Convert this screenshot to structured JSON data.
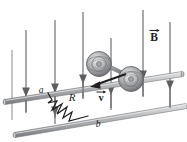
{
  "figure": {
    "title": "Conducting rod on rails in a magnetic field",
    "type": "physics-diagram",
    "canvas": {
      "width": 187,
      "height": 142,
      "background": "#ffffff"
    },
    "colors": {
      "rail": "#a8a9ad",
      "rail_edge": "#6d6e71",
      "rail_highlight": "#d6d7d9",
      "arrow": "#58595b",
      "arrow_dark": "#231f20",
      "wheel": "#a7a9ac",
      "wheel_edge": "#58595b",
      "resistor": "#231f20",
      "label": "#231f20"
    },
    "labels": {
      "terminal_a": "a",
      "terminal_b": "b",
      "resistor": "R",
      "field": "B",
      "velocity": "v"
    },
    "field_arrows": {
      "name": "magnetic-field-arrows",
      "direction": "down",
      "count": 7,
      "positions": [
        {
          "x": 26,
          "top": 30,
          "head": 92,
          "bottom": 112
        },
        {
          "x": 55,
          "top": 20,
          "head": 85,
          "bottom": 108
        },
        {
          "x": 83,
          "top": 12,
          "head": 70,
          "bottom": 96
        },
        {
          "x": 110,
          "top": 38,
          "head": 86,
          "bottom": 104
        },
        {
          "x": 112,
          "top": 40,
          "head": 62,
          "bottom": 86
        },
        {
          "x": 143,
          "top": 10,
          "head": 66,
          "bottom": 92
        },
        {
          "x": 170,
          "top": 22,
          "head": 78,
          "bottom": 102
        }
      ]
    },
    "rails": [
      {
        "name": "upper-rail",
        "x1": 6,
        "y1": 97,
        "x2": 183,
        "y2": 73
      },
      {
        "name": "lower-rail",
        "x1": 16,
        "y1": 130,
        "x2": 187,
        "y2": 104
      }
    ],
    "rod": {
      "name": "sliding-rod",
      "x1": 90,
      "y1": 63,
      "x2": 133,
      "y2": 79,
      "wheels": [
        {
          "name": "wheel-upper",
          "cx": 100,
          "cy": 64,
          "r": 12
        },
        {
          "name": "wheel-lower",
          "cx": 131,
          "cy": 79,
          "r": 12
        }
      ]
    },
    "velocity_vector": {
      "name": "velocity-arrow",
      "x_start": 124,
      "y_start": 80,
      "x_end": 93,
      "y_end": 88,
      "label_x": 99,
      "label_y": 100
    },
    "resistor": {
      "name": "resistor-zigzag",
      "label_x": 68,
      "label_y": 100,
      "path": "M 47,95 L 50,100 L 53,96 L 56,108 L 62,98 L 66,112 L 72,102 L 76,115 L 82,106"
    },
    "terminal_markers": [
      {
        "name": "terminal-a-label",
        "x": 40,
        "y": 92
      },
      {
        "name": "terminal-b-label",
        "x": 95,
        "y": 127
      }
    ]
  }
}
